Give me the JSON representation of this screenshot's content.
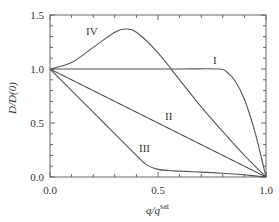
{
  "chart_data": {
    "type": "line",
    "title": "",
    "xlabel": "q/q^sat",
    "xlabel_main": "q/q",
    "xlabel_sup": "sat",
    "ylabel": "D/D(0)",
    "xlim": [
      0.0,
      1.0
    ],
    "ylim": [
      0.0,
      1.5
    ],
    "x_ticks": [
      "0.0",
      "0.5",
      "1.0"
    ],
    "y_ticks": [
      "0.0",
      "0.5",
      "1.0",
      "1.5"
    ],
    "grid": false,
    "legend": "inline curve labels",
    "series": [
      {
        "name": "I",
        "x": [
          0.0,
          0.2,
          0.4,
          0.6,
          0.78,
          0.82,
          0.86,
          0.9,
          0.94,
          0.97,
          1.0
        ],
        "y": [
          1.0,
          1.0,
          1.0,
          1.0,
          1.0,
          0.97,
          0.88,
          0.72,
          0.48,
          0.25,
          0.0
        ]
      },
      {
        "name": "II",
        "x": [
          0.0,
          0.25,
          0.5,
          0.75,
          1.0
        ],
        "y": [
          1.0,
          0.75,
          0.5,
          0.25,
          0.0
        ]
      },
      {
        "name": "III",
        "x": [
          0.0,
          0.1,
          0.2,
          0.3,
          0.4,
          0.45,
          0.5,
          0.55,
          0.6,
          0.7,
          0.8,
          0.9,
          1.0
        ],
        "y": [
          1.0,
          0.8,
          0.6,
          0.4,
          0.2,
          0.11,
          0.07,
          0.06,
          0.055,
          0.045,
          0.035,
          0.02,
          0.0
        ]
      },
      {
        "name": "IV",
        "x": [
          0.0,
          0.1,
          0.2,
          0.3,
          0.35,
          0.4,
          0.5,
          0.6,
          0.7,
          0.8,
          0.9,
          1.0
        ],
        "y": [
          1.0,
          1.06,
          1.2,
          1.34,
          1.37,
          1.34,
          1.15,
          0.9,
          0.65,
          0.42,
          0.2,
          0.0
        ]
      }
    ],
    "annotations": [
      {
        "text": "I",
        "x": 0.8,
        "y": 1.05
      },
      {
        "text": "II",
        "x": 0.6,
        "y": 0.58
      },
      {
        "text": "III",
        "x": 0.38,
        "y": 0.18
      },
      {
        "text": "IV",
        "x": 0.18,
        "y": 1.3
      }
    ]
  },
  "labels": {
    "x_tick_0": "0.0",
    "x_tick_05": "0.5",
    "x_tick_1": "1.0",
    "y_tick_0": "0.0",
    "y_tick_05": "0.5",
    "y_tick_1": "1.0",
    "y_tick_15": "1.5",
    "curve_I": "I",
    "curve_II": "II",
    "curve_III": "III",
    "curve_IV": "IV",
    "x_title_main": "q/q",
    "x_title_sup": "sat",
    "y_title": "D/D(0)"
  },
  "colors": {
    "line": "#555555",
    "axis": "#555555",
    "text": "#333333"
  }
}
